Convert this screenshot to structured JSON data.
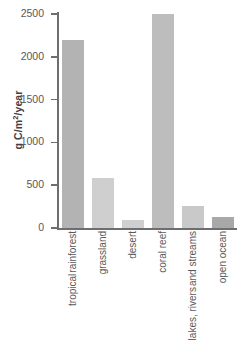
{
  "chart_data": {
    "type": "bar",
    "title": "",
    "xlabel": "",
    "ylabel": "g C/m²/year",
    "ylabel_parts": {
      "pre": "g C/m",
      "sup": "2",
      "post": "/year"
    },
    "ylim": [
      0,
      2500
    ],
    "yticks": [
      0,
      500,
      1000,
      1500,
      2000,
      2500
    ],
    "ytick_labels": [
      "0",
      "500",
      "1000",
      "1500",
      "2000",
      "2500"
    ],
    "grid": false,
    "legend": "none",
    "categories": [
      "tropical rainforest",
      "grassland",
      "desert",
      "coral reef",
      "lakes, rivers and streams",
      "open ocean"
    ],
    "category_lines": [
      [
        "tropical",
        "rainforest"
      ],
      [
        "grassland"
      ],
      [
        "desert"
      ],
      [
        "coral reef"
      ],
      [
        "lakes, rivers",
        "and streams"
      ],
      [
        "open ocean"
      ]
    ],
    "values": [
      2200,
      585,
      95,
      2500,
      255,
      125
    ],
    "bar_colors": [
      "#b3b3b3",
      "#cfcfcf",
      "#cfcfcf",
      "#bdbdbd",
      "#c9c9c9",
      "#a8a8a8"
    ]
  },
  "caption": {
    "line_1": "on",
    "line_2": "s"
  },
  "axis": {
    "line_color": "#6d6e71",
    "text_color": "#58595b",
    "title_color": "#414042"
  }
}
